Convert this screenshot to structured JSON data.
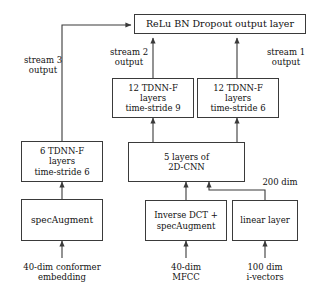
{
  "figure": {
    "line_color": "#3a3a3a",
    "text_color": "#111111",
    "background": "#ffffff"
  },
  "nodes": {
    "output_layer": {
      "label": "ReLu BN Dropout output layer"
    },
    "stream2_tdnnf": {
      "line1": "12 TDNN-F",
      "line2": "layers",
      "line3": "time-stride 9"
    },
    "stream1_tdnnf": {
      "line1": "12 TDNN-F",
      "line2": "layers",
      "line3": "time-stride 6"
    },
    "stream3_tdnnf": {
      "line1": "6 TDNN-F",
      "line2": "layers",
      "line3": "time-stride 6"
    },
    "cnn2d": {
      "line1": "5 layers of",
      "line2": "2D-CNN"
    },
    "specaugment": {
      "label": "specAugment"
    },
    "inverse_dct": {
      "line1": "Inverse DCT +",
      "line2": "specAugment"
    },
    "linear_layer": {
      "label": "linear layer"
    }
  },
  "annotations": {
    "stream3_output": {
      "line1": "stream 3",
      "line2": "output"
    },
    "stream2_output": {
      "line1": "stream 2",
      "line2": "output"
    },
    "stream1_output": {
      "line1": "stream 1",
      "line2": "output"
    },
    "dim_200": {
      "label": "200 dim"
    },
    "input_conformer": {
      "line1": "40-dim conformer",
      "line2": "embedding"
    },
    "input_mfcc": {
      "line1": "40-dim",
      "line2": "MFCC"
    },
    "input_ivectors": {
      "line1": "100 dim",
      "line2": "i-vectors"
    }
  }
}
